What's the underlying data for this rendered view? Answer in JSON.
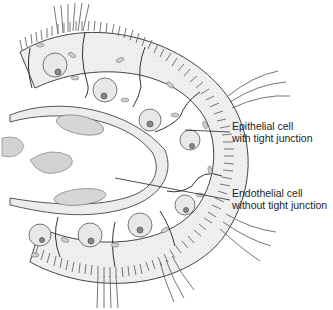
{
  "diagram": {
    "labels": [
      {
        "id": "epithelial",
        "line1": "Epithelial cell",
        "line2": "with tight junction"
      },
      {
        "id": "endothelial",
        "line1": "Endothelial cell",
        "line2": "without tight junction"
      }
    ],
    "colors": {
      "ink": "#333333",
      "cytoplasm": "#efefef",
      "nucleus": "#e6e6e6",
      "lumen_cell": "#d6d6d6",
      "background": "#ffffff"
    }
  }
}
